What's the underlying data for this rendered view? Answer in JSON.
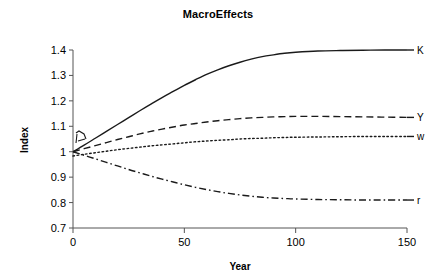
{
  "chart_data": {
    "type": "line",
    "title": "MacroEffects",
    "xlabel": "Year",
    "ylabel": "Index",
    "xlim": [
      0,
      150
    ],
    "ylim": [
      0.7,
      1.4
    ],
    "xticks": [
      "0",
      "50",
      "100",
      "150"
    ],
    "xtick_values": [
      0,
      50,
      100,
      150
    ],
    "yticks": [
      "0.7",
      "0.8",
      "0.9",
      "1",
      "1.1",
      "1.2",
      "1.3",
      "1.4"
    ],
    "ytick_values": [
      0.7,
      0.8,
      0.9,
      1.0,
      1.1,
      1.2,
      1.3,
      1.4
    ],
    "grid": false,
    "legend": "right-inline-labels",
    "x": [
      0,
      5,
      10,
      15,
      20,
      25,
      30,
      35,
      40,
      45,
      50,
      55,
      60,
      65,
      70,
      75,
      80,
      85,
      90,
      95,
      100,
      110,
      120,
      130,
      140,
      150
    ],
    "series": [
      {
        "name": "K",
        "label": "K",
        "style": "solid",
        "values": [
          1.0,
          1.026,
          1.053,
          1.08,
          1.107,
          1.134,
          1.161,
          1.187,
          1.213,
          1.237,
          1.261,
          1.283,
          1.304,
          1.322,
          1.338,
          1.352,
          1.364,
          1.374,
          1.381,
          1.387,
          1.391,
          1.396,
          1.398,
          1.399,
          1.4,
          1.4
        ]
      },
      {
        "name": "Y",
        "label": "Y",
        "style": "dashed",
        "values": [
          1.0,
          1.012,
          1.024,
          1.036,
          1.048,
          1.059,
          1.07,
          1.08,
          1.089,
          1.097,
          1.105,
          1.111,
          1.117,
          1.122,
          1.126,
          1.13,
          1.133,
          1.135,
          1.137,
          1.138,
          1.139,
          1.139,
          1.138,
          1.137,
          1.136,
          1.135
        ]
      },
      {
        "name": "w",
        "label": "w",
        "style": "dotted",
        "values": [
          0.983,
          0.99,
          0.996,
          1.002,
          1.008,
          1.013,
          1.018,
          1.023,
          1.027,
          1.031,
          1.035,
          1.039,
          1.042,
          1.045,
          1.047,
          1.05,
          1.052,
          1.053,
          1.055,
          1.056,
          1.057,
          1.058,
          1.059,
          1.06,
          1.06,
          1.06
        ]
      },
      {
        "name": "r",
        "label": "r",
        "style": "dash-dot",
        "values": [
          1.0,
          0.986,
          0.972,
          0.958,
          0.944,
          0.93,
          0.917,
          0.904,
          0.892,
          0.881,
          0.87,
          0.86,
          0.851,
          0.843,
          0.836,
          0.83,
          0.825,
          0.821,
          0.818,
          0.816,
          0.814,
          0.812,
          0.811,
          0.81,
          0.81,
          0.81
        ]
      }
    ],
    "annotations": [
      {
        "name": "origin-transient-artifact",
        "description": "small dashed loop near y-axis at approximately year 2, index 1.04"
      }
    ],
    "colors": {
      "curve": "#1a1a1a",
      "axis": "#555555",
      "background": "#ffffff"
    }
  }
}
